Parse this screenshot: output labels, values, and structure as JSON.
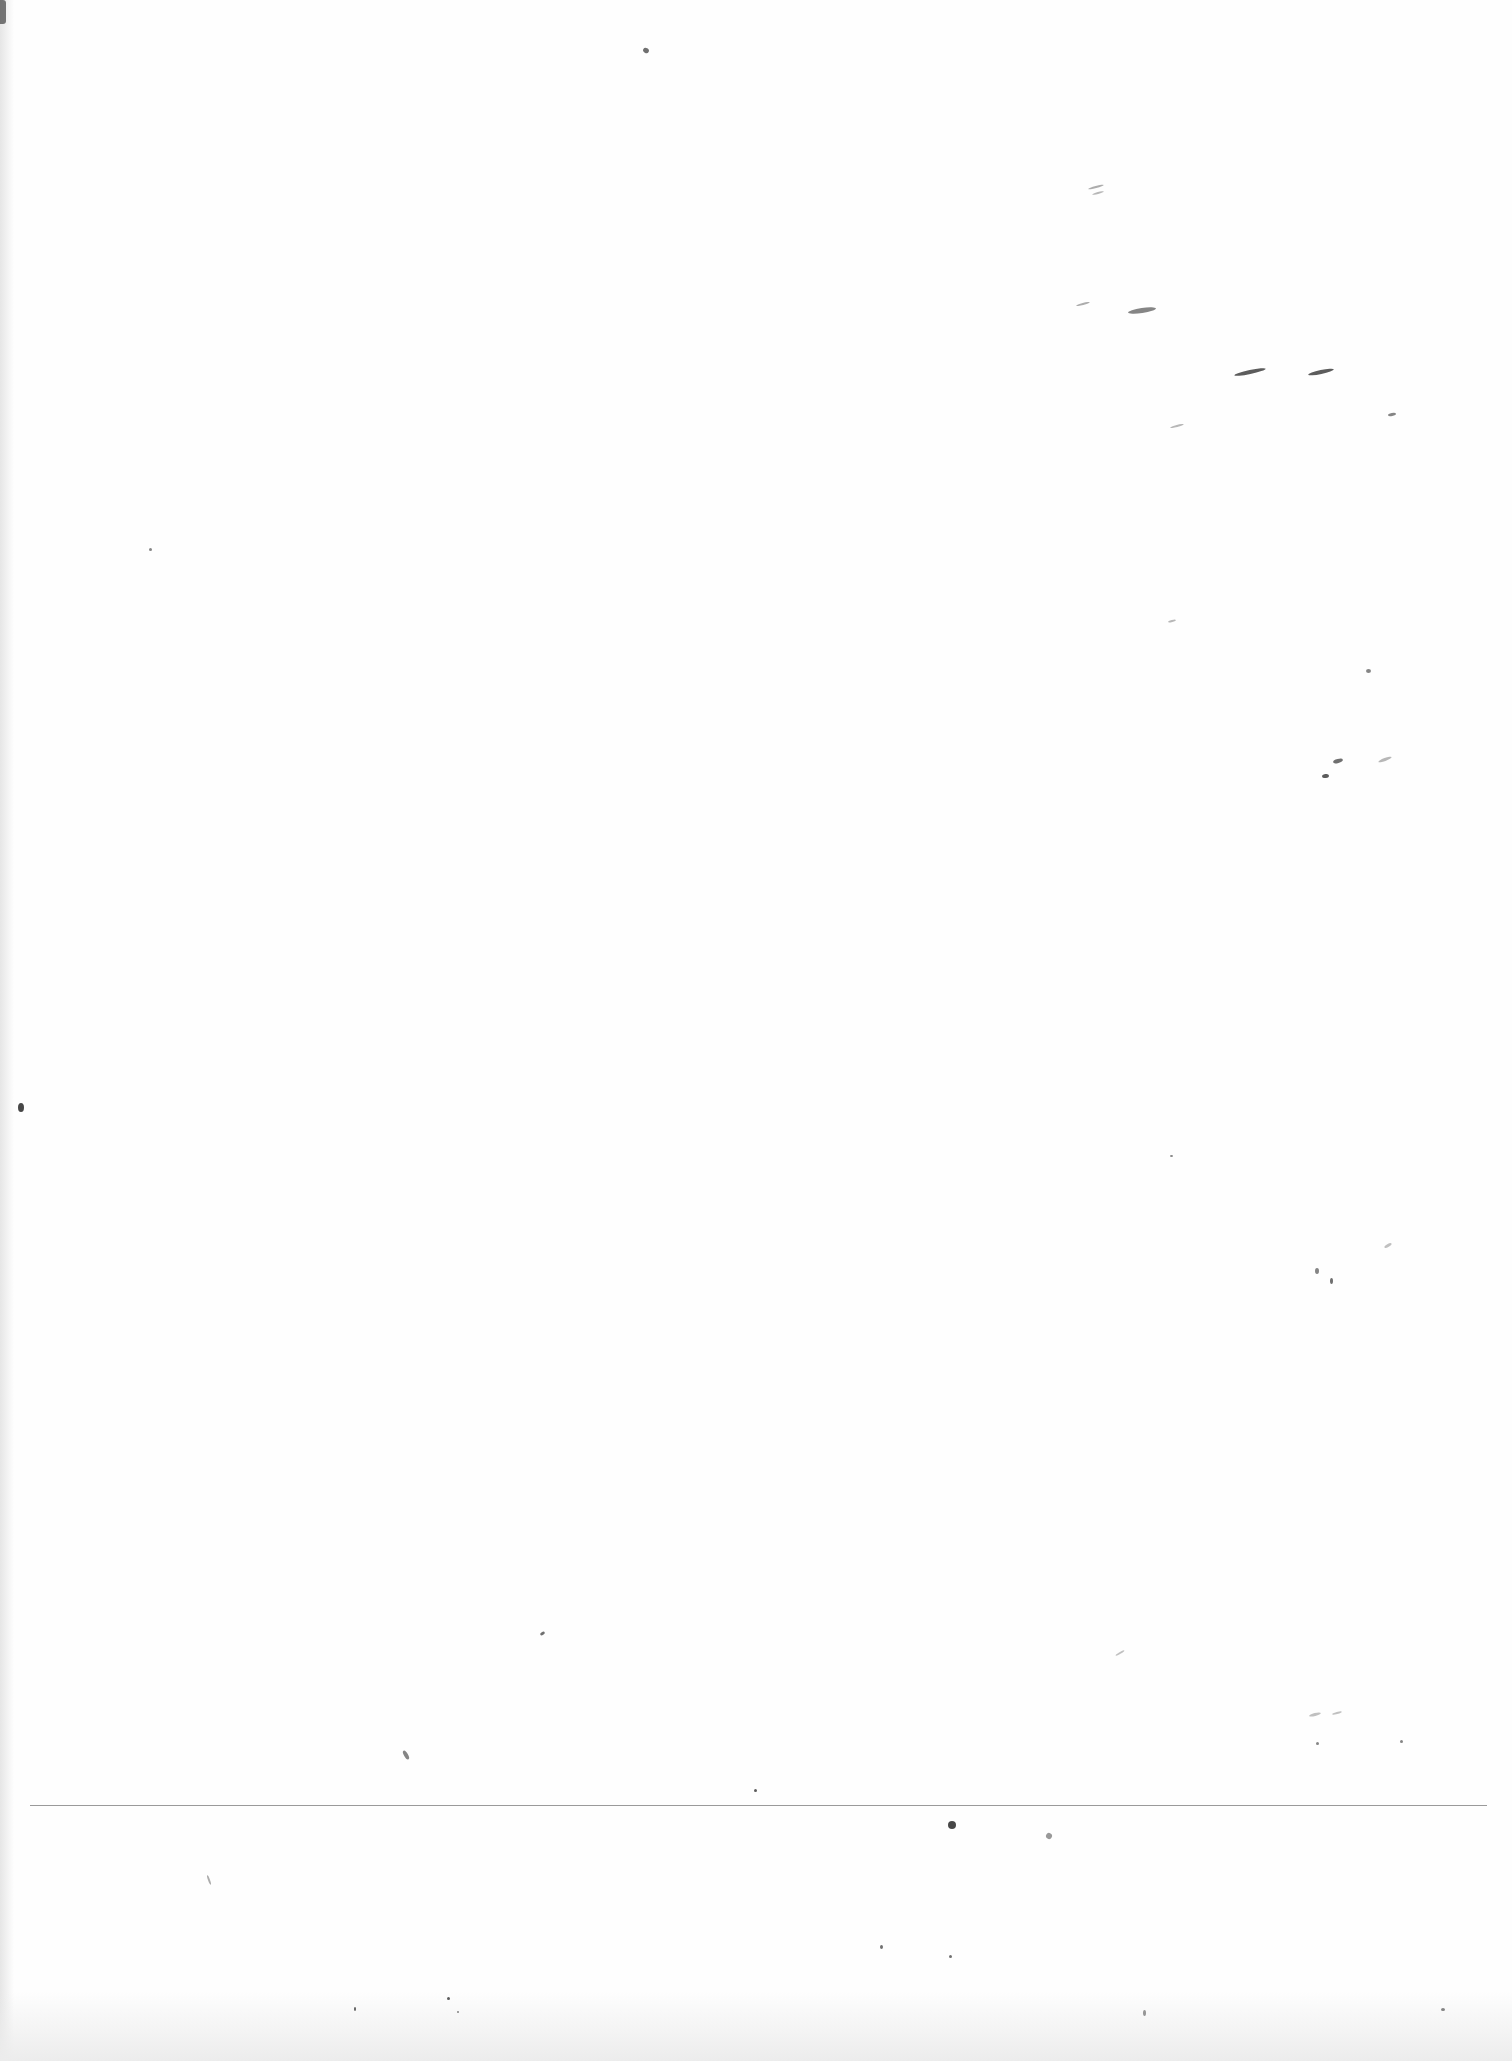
{
  "document": {
    "type": "scanned-blank-page",
    "text": "",
    "footer_rule": {
      "y": 1805,
      "x_start": 30,
      "x_end": 1487,
      "color": "#9a9a9a"
    }
  },
  "specks": [
    {
      "x": 643,
      "y": 48,
      "w": 6,
      "h": 5,
      "rot": 30,
      "o": 0.7
    },
    {
      "x": 1088,
      "y": 186,
      "w": 16,
      "h": 2,
      "rot": -15,
      "o": 0.4
    },
    {
      "x": 1092,
      "y": 192,
      "w": 12,
      "h": 2,
      "rot": -15,
      "o": 0.35
    },
    {
      "x": 1076,
      "y": 303,
      "w": 14,
      "h": 2,
      "rot": -15,
      "o": 0.4
    },
    {
      "x": 1128,
      "y": 308,
      "w": 28,
      "h": 5,
      "rot": -8,
      "o": 0.6
    },
    {
      "x": 1234,
      "y": 370,
      "w": 32,
      "h": 4,
      "rot": -12,
      "o": 0.8
    },
    {
      "x": 1308,
      "y": 370,
      "w": 26,
      "h": 4,
      "rot": -12,
      "o": 0.8
    },
    {
      "x": 1388,
      "y": 413,
      "w": 8,
      "h": 3,
      "rot": -10,
      "o": 0.6
    },
    {
      "x": 1170,
      "y": 425,
      "w": 14,
      "h": 2,
      "rot": -15,
      "o": 0.35
    },
    {
      "x": 1168,
      "y": 620,
      "w": 8,
      "h": 2,
      "rot": -15,
      "o": 0.35
    },
    {
      "x": 1366,
      "y": 669,
      "w": 5,
      "h": 4,
      "rot": 0,
      "o": 0.6
    },
    {
      "x": 1333,
      "y": 759,
      "w": 10,
      "h": 4,
      "rot": -15,
      "o": 0.7
    },
    {
      "x": 1322,
      "y": 774,
      "w": 7,
      "h": 4,
      "rot": -10,
      "o": 0.8
    },
    {
      "x": 1378,
      "y": 758,
      "w": 14,
      "h": 3,
      "rot": -20,
      "o": 0.35
    },
    {
      "x": 149,
      "y": 548,
      "w": 3,
      "h": 3,
      "rot": 0,
      "o": 0.6
    },
    {
      "x": 18,
      "y": 1103,
      "w": 6,
      "h": 9,
      "rot": 0,
      "o": 0.9
    },
    {
      "x": 1170,
      "y": 1155,
      "w": 3,
      "h": 2,
      "rot": 0,
      "o": 0.6
    },
    {
      "x": 1315,
      "y": 1268,
      "w": 4,
      "h": 6,
      "rot": 0,
      "o": 0.6
    },
    {
      "x": 1330,
      "y": 1278,
      "w": 3,
      "h": 6,
      "rot": 0,
      "o": 0.7
    },
    {
      "x": 1384,
      "y": 1244,
      "w": 8,
      "h": 3,
      "rot": -30,
      "o": 0.3
    },
    {
      "x": 540,
      "y": 1632,
      "w": 5,
      "h": 3,
      "rot": -30,
      "o": 0.7
    },
    {
      "x": 1115,
      "y": 1652,
      "w": 10,
      "h": 2,
      "rot": -30,
      "o": 0.3
    },
    {
      "x": 1309,
      "y": 1713,
      "w": 12,
      "h": 3,
      "rot": -15,
      "o": 0.3
    },
    {
      "x": 1332,
      "y": 1712,
      "w": 10,
      "h": 2,
      "rot": -15,
      "o": 0.3
    },
    {
      "x": 1316,
      "y": 1742,
      "w": 3,
      "h": 3,
      "rot": 0,
      "o": 0.6
    },
    {
      "x": 1400,
      "y": 1740,
      "w": 3,
      "h": 3,
      "rot": 0,
      "o": 0.6
    },
    {
      "x": 404,
      "y": 1750,
      "w": 4,
      "h": 10,
      "rot": -30,
      "o": 0.6
    },
    {
      "x": 754,
      "y": 1789,
      "w": 3,
      "h": 3,
      "rot": 0,
      "o": 0.8
    },
    {
      "x": 948,
      "y": 1821,
      "w": 8,
      "h": 8,
      "rot": 0,
      "o": 0.9
    },
    {
      "x": 1046,
      "y": 1833,
      "w": 6,
      "h": 6,
      "rot": 30,
      "o": 0.5
    },
    {
      "x": 208,
      "y": 1875,
      "w": 2,
      "h": 10,
      "rot": -20,
      "o": 0.4
    },
    {
      "x": 880,
      "y": 1945,
      "w": 3,
      "h": 4,
      "rot": 0,
      "o": 0.7
    },
    {
      "x": 949,
      "y": 1955,
      "w": 3,
      "h": 3,
      "rot": 0,
      "o": 0.7
    },
    {
      "x": 354,
      "y": 2007,
      "w": 2,
      "h": 4,
      "rot": 0,
      "o": 0.8
    },
    {
      "x": 447,
      "y": 1997,
      "w": 3,
      "h": 3,
      "rot": 0,
      "o": 0.8
    },
    {
      "x": 457,
      "y": 2011,
      "w": 2,
      "h": 2,
      "rot": 0,
      "o": 0.6
    },
    {
      "x": 1143,
      "y": 2010,
      "w": 3,
      "h": 6,
      "rot": 0,
      "o": 0.5
    },
    {
      "x": 1441,
      "y": 2008,
      "w": 4,
      "h": 3,
      "rot": 0,
      "o": 0.6
    }
  ]
}
